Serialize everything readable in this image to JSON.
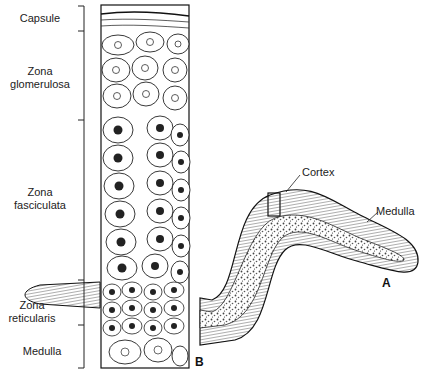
{
  "figure": {
    "panel_labels": {
      "a": "A",
      "b": "B"
    },
    "zone_labels": [
      {
        "id": "capsule",
        "text": "Capsule"
      },
      {
        "id": "zona-glomerulosa",
        "line1": "Zona",
        "line2": "glomerulosa"
      },
      {
        "id": "zona-fasciculata",
        "line1": "Zona",
        "line2": "fasciculata"
      },
      {
        "id": "zona-reticularis",
        "line1": "Zona",
        "line2": "reticularis"
      },
      {
        "id": "medulla-left",
        "text": "Medulla"
      }
    ],
    "gross_labels": {
      "cortex": "Cortex",
      "medulla": "Medulla"
    }
  }
}
